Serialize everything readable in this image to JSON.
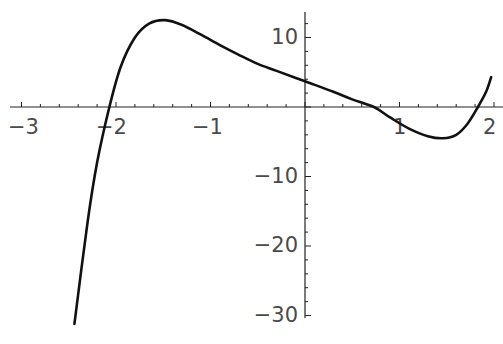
{
  "chart_data": {
    "type": "line",
    "title": "",
    "xlabel": "",
    "ylabel": "",
    "xlim": [
      -3.2,
      2.05
    ],
    "ylim": [
      -31.5,
      14
    ],
    "grid": false,
    "legend": null,
    "x_ticks": [
      -3,
      -2,
      -1,
      1,
      2
    ],
    "x_tick_labels": [
      "-3",
      "-2",
      "-1",
      "1",
      "2"
    ],
    "y_ticks": [
      10,
      -10,
      -20,
      -30
    ],
    "y_tick_labels": [
      "10",
      "-10",
      "-20",
      "-30"
    ],
    "series": [
      {
        "name": "f(x)",
        "x": [
          -2.44,
          -2.3,
          -2.2,
          -2.07,
          -1.95,
          -1.8,
          -1.65,
          -1.48,
          -1.3,
          -1.1,
          -0.9,
          -0.7,
          -0.5,
          -0.3,
          0.0,
          0.3,
          0.5,
          0.73,
          0.9,
          1.1,
          1.3,
          1.46,
          1.6,
          1.72,
          1.83,
          1.92,
          1.97
        ],
        "y": [
          -31.2,
          -16.5,
          -8.0,
          0.0,
          5.8,
          10.0,
          12.0,
          12.5,
          11.8,
          10.4,
          8.9,
          7.5,
          6.2,
          5.2,
          3.7,
          2.2,
          1.1,
          0.0,
          -1.5,
          -3.1,
          -4.2,
          -4.5,
          -4.0,
          -2.4,
          0.0,
          2.3,
          4.3
        ]
      }
    ]
  },
  "axes": {
    "x_labels": [
      "-3",
      "-2",
      "-1",
      "1",
      "2"
    ],
    "y_labels": [
      "10",
      "-10",
      "-20",
      "-30"
    ]
  }
}
